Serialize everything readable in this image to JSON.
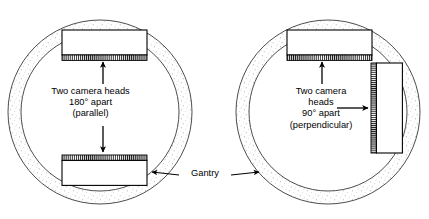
{
  "figure": {
    "background": "#ffffff",
    "stroke_color": "#000000",
    "stipple_color": "#9a9a9a",
    "width": 429,
    "height": 219
  },
  "left_diagram": {
    "name": "180-degree-parallel-configuration",
    "gantry": {
      "center_x": 100,
      "center_y": 112,
      "outer_radius": 92,
      "inner_radius": 79,
      "fill_texture": "stipple"
    },
    "caption_lines": [
      "Two camera heads",
      "180° apart",
      "(parallel)"
    ],
    "caption_text": "Two camera heads\n180° apart\n(parallel)",
    "heads": [
      {
        "name": "camera-head-top",
        "x": 62,
        "y": 30,
        "width": 85,
        "height": 27,
        "collimator_edge": "bottom"
      },
      {
        "name": "camera-head-bottom",
        "x": 62,
        "y": 158,
        "width": 85,
        "height": 27,
        "collimator_edge": "top"
      }
    ],
    "arrows": [
      {
        "name": "arrow-to-top-head",
        "x1": 103,
        "y1": 82,
        "x2": 103,
        "y2": 60,
        "head": "end"
      },
      {
        "name": "arrow-to-bottom-head",
        "x1": 103,
        "y1": 128,
        "x2": 103,
        "y2": 155,
        "head": "end"
      }
    ]
  },
  "right_diagram": {
    "name": "90-degree-perpendicular-configuration",
    "gantry": {
      "center_x": 328,
      "center_y": 112,
      "outer_radius": 92,
      "inner_radius": 79,
      "fill_texture": "stipple"
    },
    "caption_lines": [
      "Two camera",
      "heads",
      "90° apart",
      "(perpendicular)"
    ],
    "caption_text": "Two camera\nheads\n90° apart\n(perpendicular)",
    "heads": [
      {
        "name": "camera-head-top",
        "x": 287,
        "y": 30,
        "width": 85,
        "height": 27,
        "collimator_edge": "bottom"
      },
      {
        "name": "camera-head-right",
        "x": 375,
        "y": 63,
        "width": 27,
        "height": 90,
        "collimator_edge": "left"
      }
    ],
    "arrows": [
      {
        "name": "arrow-to-top-head",
        "x1": 322,
        "y1": 82,
        "x2": 322,
        "y2": 60,
        "head": "end"
      },
      {
        "name": "arrow-to-right-head",
        "x1": 340,
        "y1": 108,
        "x2": 372,
        "y2": 108,
        "head": "end"
      }
    ]
  },
  "gantry_annotation": {
    "name": "gantry-callout",
    "label": "Gantry",
    "left_arrow": {
      "x1": 178,
      "y1": 176,
      "x2": 150,
      "y2": 172
    },
    "right_arrow": {
      "x1": 232,
      "y1": 176,
      "x2": 262,
      "y2": 172
    }
  }
}
